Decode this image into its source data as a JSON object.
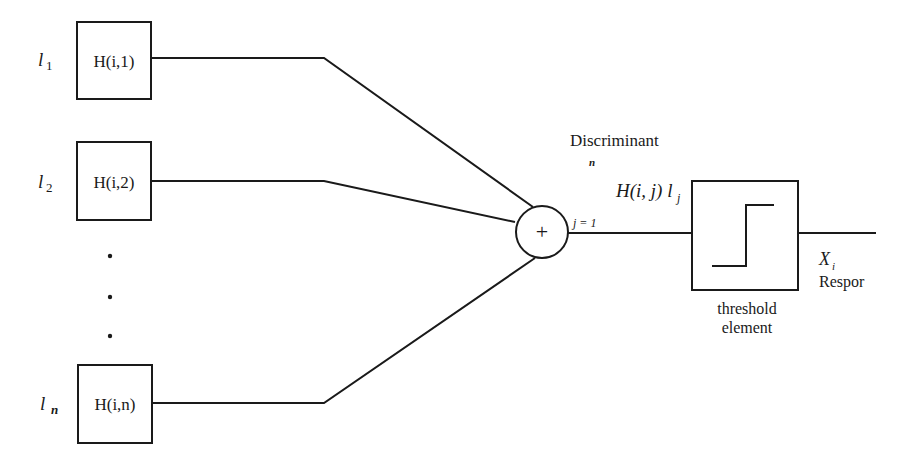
{
  "diagram": {
    "type": "block-diagram",
    "inputs": [
      {
        "label": "l",
        "subscript": "1",
        "box_label": "H(i,1)"
      },
      {
        "label": "l",
        "subscript": "2",
        "box_label": "H(i,2)"
      },
      {
        "label": "l",
        "subscript": "n",
        "box_label": "H(i,n)"
      }
    ],
    "ellipsis": "•",
    "summer": {
      "symbol": "+"
    },
    "discriminant": {
      "title": "Discriminant",
      "sum_upper": "n",
      "sum_lower": "j = 1",
      "expression": "H(i, j) l",
      "expression_subscript": "j"
    },
    "threshold": {
      "line1": "threshold",
      "line2": "element"
    },
    "output": {
      "symbol": "X",
      "subscript": "i",
      "label": "Respor"
    }
  }
}
